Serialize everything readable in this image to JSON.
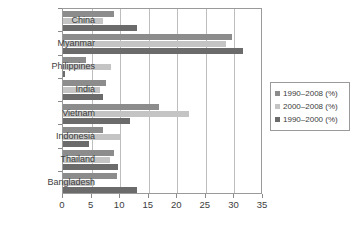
{
  "chart_data": {
    "type": "bar",
    "orientation": "horizontal",
    "title": "",
    "xlabel": "",
    "ylabel": "",
    "xlim": [
      0,
      35
    ],
    "xticks": [
      0,
      5,
      10,
      15,
      20,
      25,
      30,
      35
    ],
    "grid": true,
    "legend_position": "right",
    "categories": [
      "China",
      "Myanmar",
      "Philippines",
      "India",
      "Vietnam",
      "Indonesia",
      "Thailand",
      "Bangladesh"
    ],
    "series": [
      {
        "name": "1990–2008 (%)",
        "color": "#8c8c8c",
        "values": [
          9.0,
          29.5,
          4.0,
          7.5,
          16.8,
          7.0,
          9.0,
          9.5
        ]
      },
      {
        "name": "2000–2008 (%)",
        "color": "#c4c4c4",
        "values": [
          7.0,
          28.5,
          8.4,
          6.5,
          22.0,
          10.0,
          8.2,
          5.5
        ]
      },
      {
        "name": "1990–2000 (%)",
        "color": "#6b6b6b",
        "values": [
          13.0,
          31.5,
          0.3,
          7.0,
          11.8,
          4.5,
          9.7,
          13.0
        ]
      }
    ]
  },
  "legend": {
    "items": [
      {
        "label": "1990–2008 (%)",
        "color": "#8c8c8c"
      },
      {
        "label": "2000–2008 (%)",
        "color": "#c4c4c4"
      },
      {
        "label": "1990–2000 (%)",
        "color": "#6b6b6b"
      }
    ]
  },
  "axis": {
    "x_tick_labels": [
      "0",
      "5",
      "10",
      "15",
      "20",
      "25",
      "30",
      "35"
    ]
  }
}
